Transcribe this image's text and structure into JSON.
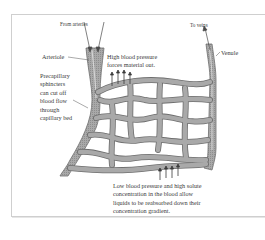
{
  "diagram": {
    "type": "capillary-bed",
    "labels": {
      "from_arteries": "From arteries",
      "to_veins": "To veins",
      "arteriole": "Arteriole",
      "venule": "Venule",
      "high_pressure": [
        "High blood pressure",
        "forces material out."
      ],
      "sphincters": [
        "Precapillary",
        "sphincters",
        "can cut off",
        "blood flow",
        "through",
        "capillary bed"
      ],
      "low_pressure": [
        "Low blood pressure and high solute",
        "concentration in the blood allow",
        "liquids to be reabsorbed down their",
        "concentration gradient."
      ]
    },
    "colors": {
      "vessel_fill": "#a9a9a9",
      "vessel_edge": "#6e6e6e",
      "vessel_highlight": "#d4d4d4",
      "arrow": "#4a4a4a",
      "frame": "#cfcfcf",
      "text": "#3a3a3a"
    },
    "arrows": {
      "outflow_count": 4,
      "inflow_count": 4
    }
  }
}
